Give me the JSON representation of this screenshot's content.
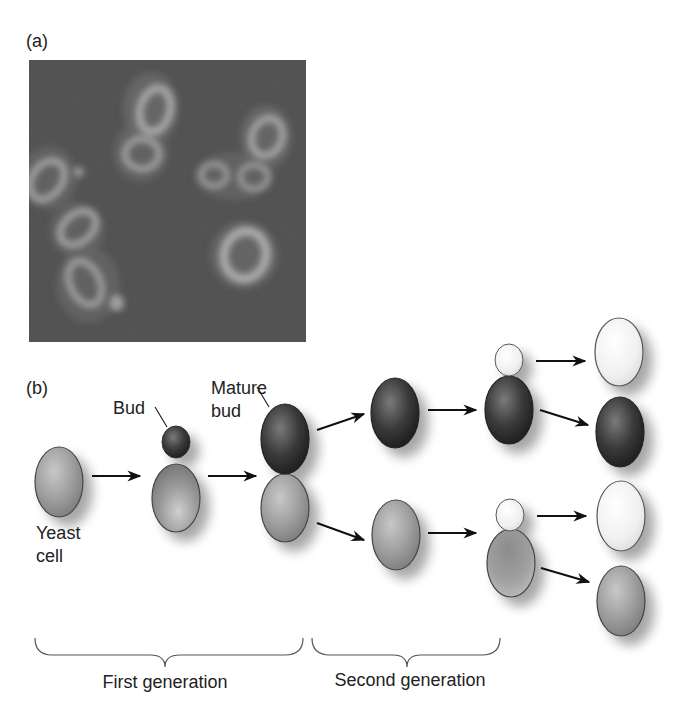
{
  "panel_a": {
    "label": "(a)",
    "description": "Micrograph of budding yeast cells"
  },
  "panel_b": {
    "label": "(b)",
    "annotations": {
      "bud": "Bud",
      "mature_bud_line1": "Mature",
      "mature_bud_line2": "bud",
      "yeast_cell_line1": "Yeast",
      "yeast_cell_line2": "cell"
    },
    "generations": [
      {
        "label": "First generation"
      },
      {
        "label": "Second generation"
      }
    ]
  },
  "colors": {
    "background": "#ffffff",
    "micrograph_bg": "#4a4a4a",
    "cell_medium": "#9a9a9a",
    "cell_dark": "#2e2e2e",
    "cell_light": "#f2f2f2",
    "outline": "#333333",
    "text": "#222222"
  }
}
